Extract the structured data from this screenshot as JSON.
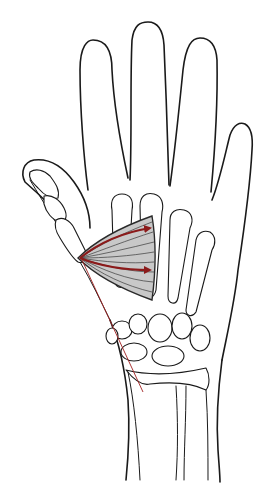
{
  "figure": {
    "colors": {
      "outline": "#1a1a1a",
      "muscle_fill": "#c8c8c8",
      "muscle_edge": "#2a2a2a",
      "arrow": "#8b1a1a",
      "line_of_pull": "#a02020",
      "background": "#ffffff"
    },
    "elements": [
      {
        "name": "hand-outline",
        "description": "Outline of hand with four fingers and thumb"
      },
      {
        "name": "metacarpals",
        "count": 5
      },
      {
        "name": "carpal-bones",
        "count": 8
      },
      {
        "name": "radius-ulna",
        "count": 2
      },
      {
        "name": "adductor-muscle",
        "description": "Fan-shaped grey muscle with fibers"
      },
      {
        "name": "force-arrows",
        "count": 2,
        "description": "Red arrows from thumb insertion toward 2nd/3rd metacarpals"
      },
      {
        "name": "line-of-pull",
        "description": "Thin red line from thumb base diagonally down to wrist"
      }
    ]
  }
}
